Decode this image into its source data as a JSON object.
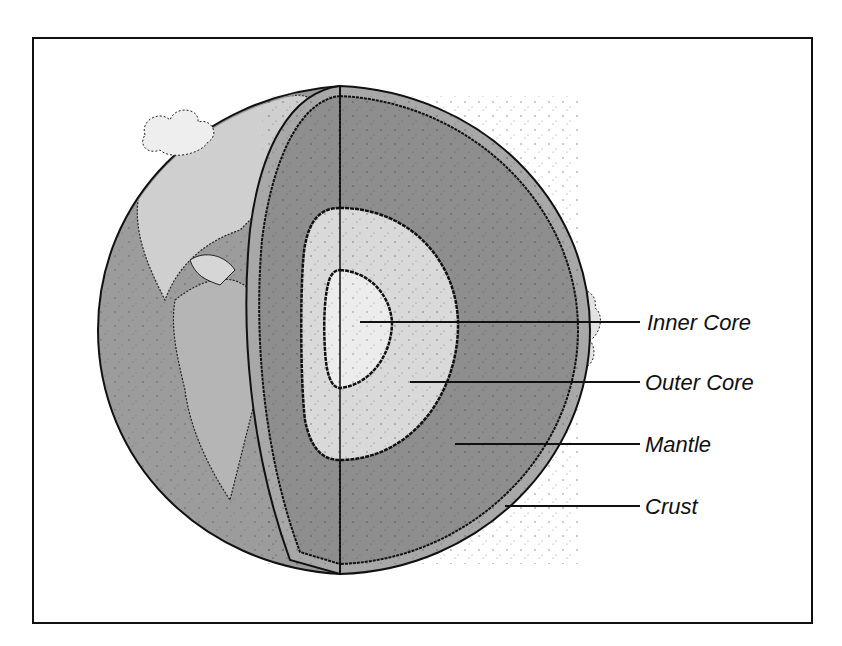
{
  "diagram": {
    "labels": [
      {
        "id": "inner-core",
        "text": "Inner Core"
      },
      {
        "id": "outer-core",
        "text": "Outer Core"
      },
      {
        "id": "mantle",
        "text": "Mantle"
      },
      {
        "id": "crust",
        "text": "Crust"
      }
    ],
    "colors": {
      "frame": "#111111",
      "ocean": "#9a9a9a",
      "land": "#c4c4c4",
      "mantle": "#8e8e8e",
      "outer_core": "#d9d9d9",
      "inner_core": "#ececec",
      "crust": "#a8a8a8"
    }
  }
}
